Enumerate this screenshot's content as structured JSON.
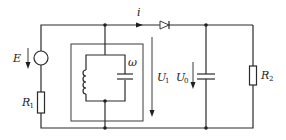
{
  "diagram": {
    "type": "circuit",
    "labels": {
      "source": "E",
      "resistor_1": "R",
      "resistor_1_sub": "1",
      "current": "i",
      "tank_freq": "ω",
      "voltage_1": "U",
      "voltage_1_sub": "1",
      "voltage_0": "U",
      "voltage_0_sub": "0",
      "resistor_2": "R",
      "resistor_2_sub": "2"
    },
    "components": [
      {
        "id": "E",
        "kind": "voltage-source"
      },
      {
        "id": "R1",
        "kind": "resistor"
      },
      {
        "id": "LC-tank",
        "kind": "parallel-LC",
        "enclosed": true
      },
      {
        "id": "D",
        "kind": "diode"
      },
      {
        "id": "C",
        "kind": "capacitor"
      },
      {
        "id": "R2",
        "kind": "resistor"
      }
    ],
    "colors": {
      "line": "#2a2a2a",
      "background": "#ffffff"
    }
  }
}
